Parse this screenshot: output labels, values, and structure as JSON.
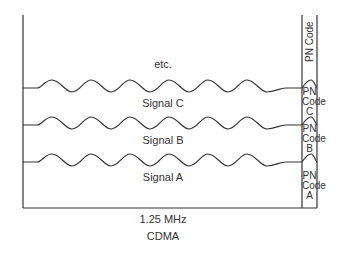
{
  "diagram": {
    "type": "cdma-channel-diagram",
    "signals": [
      {
        "label": "etc.",
        "pn_code": "PN Code"
      },
      {
        "label": "Signal C",
        "pn_code": [
          "PN",
          "Code",
          "C"
        ]
      },
      {
        "label": "Signal B",
        "pn_code": [
          "PN",
          "Code",
          "B"
        ]
      },
      {
        "label": "Signal A",
        "pn_code": [
          "PN",
          "Code",
          "A"
        ]
      }
    ],
    "labels": {
      "etc": "etc.",
      "signal_c": "Signal C",
      "signal_b": "Signal B",
      "signal_a": "Signal A",
      "pn_top": "PN Code",
      "pn_c": {
        "l1": "PN",
        "l2": "Code",
        "l3": "C"
      },
      "pn_b": {
        "l1": "PN",
        "l2": "Code",
        "l3": "B"
      },
      "pn_a": {
        "l1": "PN",
        "l2": "Code",
        "l3": "A"
      },
      "bandwidth": "1.25 MHz",
      "technology": "CDMA"
    },
    "colors": {
      "line": "#333333",
      "background": "#ffffff"
    }
  }
}
